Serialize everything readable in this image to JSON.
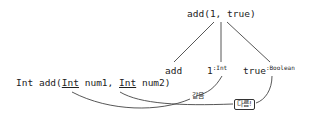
{
  "root_call": "add(1, true)",
  "children": [
    {
      "label": "add",
      "type": ""
    },
    {
      "label": "1",
      "type": ":Int"
    },
    {
      "label": "true",
      "type": ":Boolean"
    }
  ],
  "signature": {
    "return_type": "Int",
    "name": "add(",
    "param1_type": "Int",
    "param1_name": " num1, ",
    "param2_type": "Int",
    "param2_name": " num2)"
  },
  "annotations": {
    "same": "같음",
    "different": "다름!"
  },
  "colors": {
    "line": "#444444",
    "text": "#222222"
  }
}
